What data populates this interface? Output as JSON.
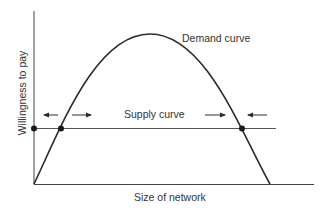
{
  "diagram": {
    "type": "economics-network-effects",
    "colors": {
      "axis": "#444444",
      "curve": "#2a2a2a",
      "supply": "#555555",
      "text": "#333333",
      "background": "#ffffff"
    },
    "axes": {
      "xlabel": "Size of network",
      "ylabel": "Willingness to pay"
    },
    "curves": {
      "demand_label": "Demand curve",
      "supply_label": "Supply curve"
    },
    "points": [
      {
        "name": "axis-equilibrium",
        "desc": "supply meets y-axis"
      },
      {
        "name": "critical-mass",
        "desc": "left intersection (unstable)"
      },
      {
        "name": "stable-equilibrium",
        "desc": "right intersection (stable)"
      }
    ],
    "arrows": [
      {
        "name": "left-arrow-outward-left",
        "direction": "left"
      },
      {
        "name": "left-arrow-outward-right",
        "direction": "right"
      },
      {
        "name": "right-arrow-inward-right",
        "direction": "right"
      },
      {
        "name": "right-arrow-inward-left",
        "direction": "left"
      }
    ]
  }
}
